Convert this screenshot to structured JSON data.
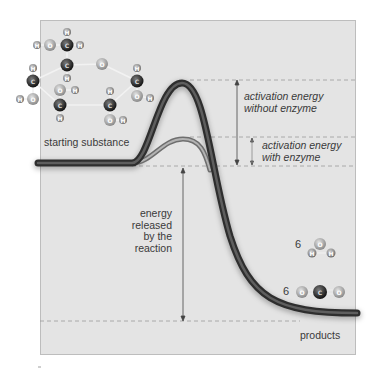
{
  "diagram": {
    "colors": {
      "panel_bg": "#e4e4e4",
      "panel_border": "#bdbdbd",
      "curve_dark": "#3f3f3f",
      "curve_mid": "#6a6a6a",
      "enzyme_curve": "#9a9a9a",
      "dashed_line": "#9a9a9a",
      "text": "#3a3a3a",
      "carbon": "#2a2a2a",
      "oxygen": "#a8a8a8",
      "hydrogen": "#8c8c8c"
    },
    "labels": {
      "starting_substance": "starting substance",
      "products": "products",
      "activation_without": [
        "activation energy",
        "without enzyme"
      ],
      "activation_with": [
        "activation energy",
        "with enzyme"
      ],
      "energy_released": [
        "energy",
        "released",
        "by the",
        "reaction"
      ]
    },
    "products": {
      "water": {
        "count": "6",
        "atoms": [
          "O",
          "H",
          "H"
        ]
      },
      "co2": {
        "count": "6",
        "atoms": [
          "O",
          "C",
          "O"
        ]
      }
    },
    "levels": {
      "start_y": 163,
      "peak_without_y": 80,
      "peak_with_y": 137,
      "products_y": 321
    }
  }
}
